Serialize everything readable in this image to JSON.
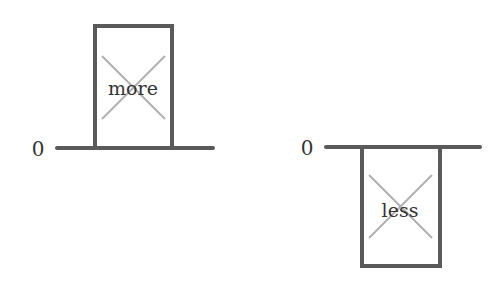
{
  "colors": {
    "stroke": "#5a5a5a",
    "cross": "#b0b0b0",
    "text": "#333333",
    "background": "#ffffff"
  },
  "left_panel": {
    "axis_label": "0",
    "box_label": "more",
    "direction": "above-zero"
  },
  "right_panel": {
    "axis_label": "0",
    "box_label": "less",
    "direction": "below-zero"
  }
}
